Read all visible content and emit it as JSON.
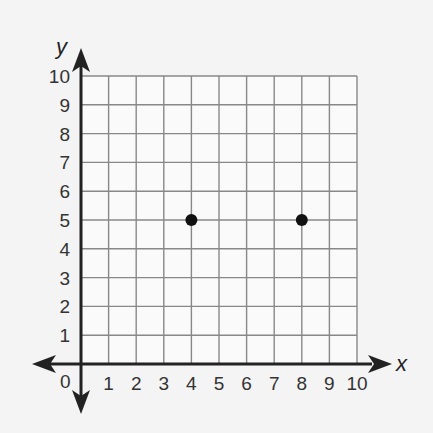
{
  "chart_data": {
    "type": "scatter",
    "title": "",
    "xlabel": "x",
    "ylabel": "y",
    "xlim": [
      0,
      10
    ],
    "ylim": [
      0,
      10
    ],
    "grid": true,
    "x_ticks": [
      "1",
      "2",
      "3",
      "4",
      "5",
      "6",
      "7",
      "8",
      "9",
      "10"
    ],
    "y_ticks": [
      "1",
      "2",
      "3",
      "4",
      "5",
      "6",
      "7",
      "8",
      "9",
      "10"
    ],
    "origin_label": "0",
    "series": [
      {
        "name": "points",
        "points": [
          {
            "x": 4,
            "y": 5
          },
          {
            "x": 8,
            "y": 5
          }
        ]
      }
    ]
  },
  "colors": {
    "background": "#f4f4f4",
    "grid": "#888888",
    "axis": "#222222",
    "point": "#111111"
  }
}
